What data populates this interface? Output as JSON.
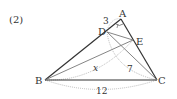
{
  "problem_number": "(2)",
  "points": {
    "A": {
      "label": "A",
      "x": 121,
      "y": 19
    },
    "B": {
      "label": "B",
      "x": 45,
      "y": 80
    },
    "C": {
      "label": "C",
      "x": 157,
      "y": 80
    },
    "D": {
      "label": "D",
      "x": 107,
      "y": 32
    },
    "E": {
      "label": "E",
      "x": 133,
      "y": 40
    }
  },
  "measures": {
    "AD": "3",
    "BE": "x",
    "DC": "7",
    "BC": "12"
  },
  "colors": {
    "line": "#333333",
    "thin_line": "#777777",
    "arc": "#bbbbbb",
    "text": "#333333"
  }
}
